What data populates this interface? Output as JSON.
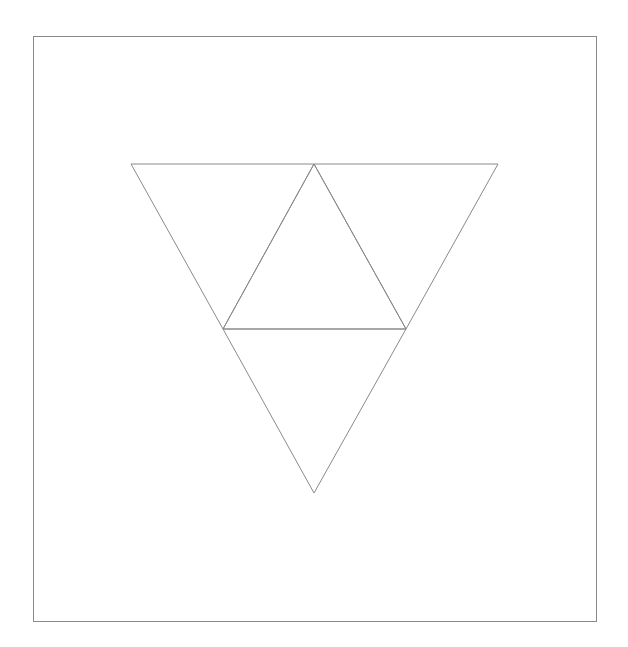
{
  "diagram": {
    "colors": {
      "background": "#ffffff",
      "frame_stroke": "#8a8a8a",
      "line_stroke": "#8a8a8a"
    },
    "frame": {
      "x": 33.5,
      "y": 36.5,
      "width": 563,
      "height": 585
    },
    "vertices": {
      "top_left": [
        131,
        164
      ],
      "top_mid": [
        314,
        164
      ],
      "top_right": [
        498,
        164
      ],
      "mid_left": [
        223,
        329
      ],
      "mid_right": [
        406,
        329
      ],
      "bottom": [
        314,
        493
      ]
    },
    "triangles": [
      {
        "name": "top-left-triangle",
        "points": "131,164 314,164 223,329"
      },
      {
        "name": "top-right-triangle",
        "points": "314,164 498,164 406,329"
      },
      {
        "name": "center-triangle",
        "points": "314,164 406,329 223,329"
      },
      {
        "name": "bottom-triangle",
        "points": "223,329 406,329 314,493"
      }
    ]
  }
}
